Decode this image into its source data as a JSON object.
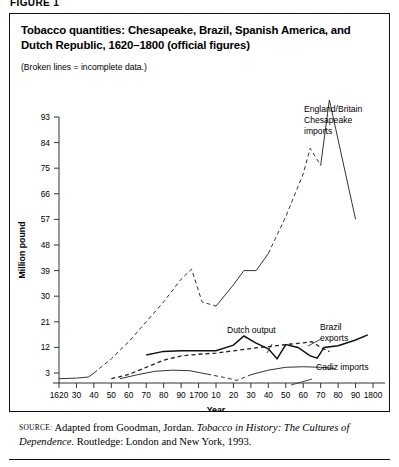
{
  "figure": {
    "label": "FIGURE 1",
    "title": "Tobacco quantities: Chesapeake, Brazil, Spanish America, and Dutch Republic, 1620–1800 (official figures)",
    "note": "(Broken lines = incomplete data.)",
    "source_label": "source:",
    "source_text_1": "Adapted from Goodman, Jordan. ",
    "source_italic_1": "Tobacco in History: The Cultures of",
    "source_italic_2": "Dependence",
    "source_text_2": ". Routledge: London and New York, 1993."
  },
  "chart_data": {
    "type": "line",
    "title": "Tobacco quantities: Chesapeake, Brazil, Spanish America, and Dutch Republic, 1620–1800 (official figures)",
    "subtitle": "(Broken lines = incomplete data.)",
    "xlabel": "Year",
    "ylabel": "Million pound",
    "xlim": [
      1620,
      1800
    ],
    "ylim": [
      0,
      97
    ],
    "grid": false,
    "legend": "inline-annotations",
    "xticks": [
      1620,
      1630,
      1640,
      1650,
      1660,
      1670,
      1680,
      1690,
      1700,
      1710,
      1720,
      1730,
      1740,
      1750,
      1760,
      1770,
      1780,
      1790,
      1800
    ],
    "xticklabels": [
      "1620",
      "30",
      "40",
      "50",
      "60",
      "70",
      "80",
      "90",
      "1700",
      "10",
      "20",
      "30",
      "40",
      "50",
      "60",
      "70",
      "80",
      "90",
      "1800"
    ],
    "yticks": [
      3,
      12,
      21,
      30,
      39,
      48,
      57,
      66,
      75,
      84,
      93
    ],
    "yticklabels": [
      "3",
      "12",
      "21",
      "30",
      "39",
      "48",
      "57",
      "66",
      "75",
      "84",
      "93"
    ],
    "series": [
      {
        "name": "England/Britain Chesapeake imports",
        "label": "England/Britain\nChesapeake\nimports",
        "style": "mixed",
        "color": "#333333",
        "points": [
          {
            "x": 1620,
            "y": 1.0,
            "dashed": false
          },
          {
            "x": 1630,
            "y": 1.2,
            "dashed": false
          },
          {
            "x": 1637,
            "y": 1.6,
            "dashed": false
          },
          {
            "x": 1640,
            "y": 3.0,
            "dashed": true
          },
          {
            "x": 1650,
            "y": 8.0,
            "dashed": true
          },
          {
            "x": 1660,
            "y": 14.0,
            "dashed": true
          },
          {
            "x": 1670,
            "y": 21.0,
            "dashed": true
          },
          {
            "x": 1680,
            "y": 28.0,
            "dashed": true
          },
          {
            "x": 1690,
            "y": 36.0,
            "dashed": true
          },
          {
            "x": 1696,
            "y": 39.5,
            "dashed": true
          },
          {
            "x": 1702,
            "y": 28.0,
            "dashed": true
          },
          {
            "x": 1710,
            "y": 26.5,
            "dashed": false
          },
          {
            "x": 1720,
            "y": 34.0,
            "dashed": false
          },
          {
            "x": 1726,
            "y": 39.0,
            "dashed": false
          },
          {
            "x": 1733,
            "y": 39.0,
            "dashed": false
          },
          {
            "x": 1740,
            "y": 45.0,
            "dashed": true
          },
          {
            "x": 1750,
            "y": 58.0,
            "dashed": true
          },
          {
            "x": 1760,
            "y": 73.0,
            "dashed": true
          },
          {
            "x": 1764,
            "y": 82.0,
            "dashed": true
          },
          {
            "x": 1770,
            "y": 76.0,
            "dashed": false
          },
          {
            "x": 1775,
            "y": 99.0,
            "dashed": false
          },
          {
            "x": 1790,
            "y": 57.0,
            "dashed": false
          }
        ]
      },
      {
        "name": "Dutch output",
        "label": "Dutch output",
        "style": "dashed",
        "color": "#222222",
        "points": [
          {
            "x": 1650,
            "y": 1.0
          },
          {
            "x": 1660,
            "y": 2.5
          },
          {
            "x": 1670,
            "y": 5.0
          },
          {
            "x": 1680,
            "y": 7.5
          },
          {
            "x": 1690,
            "y": 9.0
          },
          {
            "x": 1700,
            "y": 9.6
          },
          {
            "x": 1710,
            "y": 10.0
          },
          {
            "x": 1720,
            "y": 10.8
          },
          {
            "x": 1730,
            "y": 11.6
          },
          {
            "x": 1740,
            "y": 12.3
          },
          {
            "x": 1750,
            "y": 13.0
          },
          {
            "x": 1760,
            "y": 13.6
          },
          {
            "x": 1765,
            "y": 14.0
          },
          {
            "x": 1770,
            "y": 12.0
          },
          {
            "x": 1775,
            "y": 10.5
          }
        ]
      },
      {
        "name": "Brazil exports",
        "label": "Brazil\nexports",
        "style": "solid",
        "color": "#111111",
        "points": [
          {
            "x": 1670,
            "y": 9.3
          },
          {
            "x": 1680,
            "y": 10.6
          },
          {
            "x": 1690,
            "y": 10.8
          },
          {
            "x": 1700,
            "y": 10.8
          },
          {
            "x": 1710,
            "y": 10.8
          },
          {
            "x": 1720,
            "y": 12.8
          },
          {
            "x": 1726,
            "y": 16.0
          },
          {
            "x": 1733,
            "y": 13.5
          },
          {
            "x": 1740,
            "y": 11.5
          },
          {
            "x": 1745,
            "y": 8.0
          },
          {
            "x": 1750,
            "y": 13.0
          },
          {
            "x": 1757,
            "y": 12.0
          },
          {
            "x": 1764,
            "y": 9.0
          },
          {
            "x": 1768,
            "y": 8.2
          },
          {
            "x": 1772,
            "y": 12.0
          },
          {
            "x": 1780,
            "y": 12.6
          },
          {
            "x": 1790,
            "y": 14.6
          },
          {
            "x": 1797,
            "y": 16.4
          }
        ]
      },
      {
        "name": "Cadiz imports",
        "label": "Cadiz imports",
        "style": "mixed",
        "color": "#333333",
        "points": [
          {
            "x": 1655,
            "y": 1.0,
            "dashed": false
          },
          {
            "x": 1665,
            "y": 2.4,
            "dashed": false
          },
          {
            "x": 1675,
            "y": 3.6,
            "dashed": false
          },
          {
            "x": 1685,
            "y": 4.0,
            "dashed": false
          },
          {
            "x": 1695,
            "y": 3.8,
            "dashed": false
          },
          {
            "x": 1705,
            "y": 2.6,
            "dashed": true
          },
          {
            "x": 1715,
            "y": 1.4,
            "dashed": true
          },
          {
            "x": 1722,
            "y": 0.4,
            "dashed": true
          },
          {
            "x": 1730,
            "y": 2.4,
            "dashed": false
          },
          {
            "x": 1740,
            "y": 4.0,
            "dashed": false
          },
          {
            "x": 1750,
            "y": 5.0,
            "dashed": false
          },
          {
            "x": 1760,
            "y": 5.2,
            "dashed": false
          },
          {
            "x": 1770,
            "y": 5.0,
            "dashed": false
          },
          {
            "x": 1778,
            "y": 4.6,
            "dashed": false
          }
        ]
      }
    ],
    "annotations": [
      {
        "name": "england-britain-label",
        "lines": [
          "England/Britain",
          "Chesapeake",
          "imports"
        ],
        "x": 304,
        "y": 112
      },
      {
        "name": "dutch-output-label",
        "lines": [
          "Dutch output"
        ],
        "x": 227,
        "y": 333
      },
      {
        "name": "brazil-exports-label",
        "lines": [
          "Brazil",
          "exports"
        ],
        "x": 320,
        "y": 330
      },
      {
        "name": "cadiz-imports-label",
        "lines": [
          "Cadiz imports"
        ],
        "x": 316,
        "y": 370
      }
    ]
  }
}
